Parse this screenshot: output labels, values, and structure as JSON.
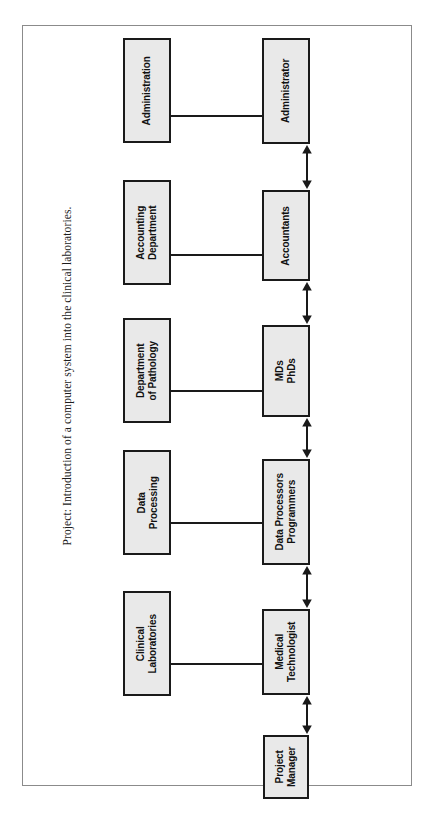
{
  "document": {
    "title": "Project: Introduction of a computer system into the clinical laboratories.",
    "orientation": "rotated-90-ccw",
    "frame_color": "#8b8b8b",
    "box_fill": "#e9e9e9",
    "box_border": "#1a1a1a",
    "line_color": "#1a1a1a"
  },
  "diagram": {
    "type": "organizational-block-diagram",
    "department_nodes": [
      {
        "id": "administration",
        "label": "Administration"
      },
      {
        "id": "accounting-department",
        "label": "Accounting\nDepartment"
      },
      {
        "id": "department-of-pathology",
        "label": "Department\nof Pathology"
      },
      {
        "id": "data-processing",
        "label": "Data\nProcessing"
      },
      {
        "id": "clinical-laboratories",
        "label": "Clinical\nLaboratories"
      }
    ],
    "role_nodes": [
      {
        "id": "administrator",
        "label": "Administrator"
      },
      {
        "id": "accountants",
        "label": "Accountants"
      },
      {
        "id": "mds-phds",
        "label": "MDs\nPhDs"
      },
      {
        "id": "data-processors",
        "label": "Data Processors\nProgrammers"
      },
      {
        "id": "medical-technologist",
        "label": "Medical\nTechnologist"
      },
      {
        "id": "project-manager",
        "label": "Project\nManager"
      }
    ],
    "connections": [
      {
        "from": "administration",
        "to": "administrator",
        "style": "plain-line"
      },
      {
        "from": "accounting-department",
        "to": "accountants",
        "style": "plain-line"
      },
      {
        "from": "department-of-pathology",
        "to": "mds-phds",
        "style": "plain-line"
      },
      {
        "from": "data-processing",
        "to": "data-processors",
        "style": "plain-line"
      },
      {
        "from": "clinical-laboratories",
        "to": "medical-technologist",
        "style": "plain-line"
      },
      {
        "from": "administrator",
        "to": "accountants",
        "style": "double-arrow"
      },
      {
        "from": "accountants",
        "to": "mds-phds",
        "style": "double-arrow"
      },
      {
        "from": "mds-phds",
        "to": "data-processors",
        "style": "double-arrow"
      },
      {
        "from": "data-processors",
        "to": "medical-technologist",
        "style": "double-arrow"
      },
      {
        "from": "medical-technologist",
        "to": "project-manager",
        "style": "double-arrow"
      }
    ]
  }
}
